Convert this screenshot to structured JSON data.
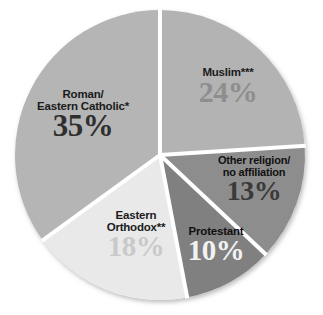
{
  "chart_data": {
    "type": "pie",
    "title": "",
    "xlabel": "",
    "ylabel": "",
    "categories": [
      "Muslim***",
      "Other religion/ no affiliation",
      "Protestant",
      "Eastern Orthodox**",
      "Roman/ Eastern Catholic*"
    ],
    "values": [
      24,
      13,
      10,
      18,
      35
    ],
    "value_labels": [
      "24%",
      "13%",
      "10%",
      "18%",
      "35%"
    ],
    "unit": "%",
    "total": 100,
    "start_angle_deg": 0,
    "direction": "clockwise",
    "legend": "none",
    "grid": false,
    "slices": [
      {
        "name": "Muslim***",
        "name_lines": [
          "Muslim***"
        ],
        "value": 24,
        "value_label": "24%",
        "fill": "#b3b3b3",
        "value_color": "#8e8e8e",
        "name_color": "#1b1b1b",
        "start_deg": 0,
        "end_deg": 86.4
      },
      {
        "name": "Other religion/ no affiliation",
        "name_lines": [
          "Other religion/",
          "no affiliation"
        ],
        "value": 13,
        "value_label": "13%",
        "fill": "#8d8d8d",
        "value_color": "#3a3a3a",
        "name_color": "#111111",
        "start_deg": 86.4,
        "end_deg": 133.2
      },
      {
        "name": "Protestant",
        "name_lines": [
          "Protestant"
        ],
        "value": 10,
        "value_label": "10%",
        "fill": "#808080",
        "value_color": "#f2f2f2",
        "name_color": "#0f0f0f",
        "start_deg": 133.2,
        "end_deg": 169.2
      },
      {
        "name": "Eastern Orthodox**",
        "name_lines": [
          "Eastern",
          "Orthodox**"
        ],
        "value": 18,
        "value_label": "18%",
        "fill": "#e9e9e9",
        "value_color": "#c9c9c9",
        "name_color": "#1b1b1b",
        "start_deg": 169.2,
        "end_deg": 234.0
      },
      {
        "name": "Roman/ Eastern Catholic*",
        "name_lines": [
          "Roman/",
          "Eastern Catholic*"
        ],
        "value": 35,
        "value_label": "35%",
        "fill": "#b5b5b5",
        "value_color": "#2f2f2f",
        "name_color": "#1b1b1b",
        "start_deg": 234.0,
        "end_deg": 360.0
      }
    ],
    "footnote_markers": {
      "single_asterisk": "*",
      "double_asterisk": "**",
      "triple_asterisk": "***"
    },
    "geometry": {
      "center_x": 160,
      "center_y": 155,
      "radius": 145,
      "separator_color": "#ffffff",
      "separator_width": 4
    }
  }
}
